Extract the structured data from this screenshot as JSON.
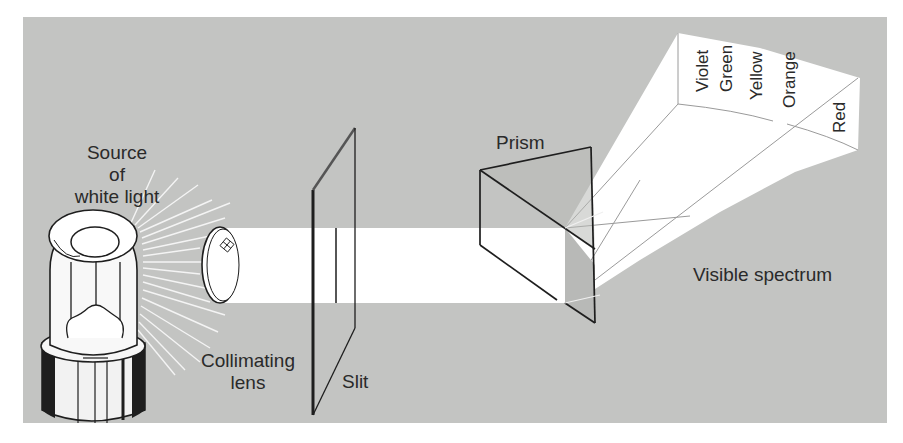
{
  "diagram": {
    "colors": {
      "background": "#ffffff",
      "panel": "#c3c4c2",
      "light_beam": "#ffffff",
      "outline": "#1e1e1e"
    },
    "labels": {
      "source": [
        "Source",
        "of",
        "white light"
      ],
      "lens": [
        "Collimating",
        "lens"
      ],
      "slit": "Slit",
      "prism": "Prism",
      "spectrum": "Visible spectrum"
    },
    "spectrum_colors": [
      "Violet",
      "Green",
      "Yellow",
      "Orange",
      "Red"
    ],
    "components": [
      {
        "name": "Source of white light",
        "type": "light-bulb"
      },
      {
        "name": "Collimating lens",
        "type": "lens"
      },
      {
        "name": "Slit",
        "type": "slit-plate"
      },
      {
        "name": "Prism",
        "type": "triangular-prism"
      },
      {
        "name": "Visible spectrum",
        "type": "dispersed-light"
      }
    ]
  }
}
